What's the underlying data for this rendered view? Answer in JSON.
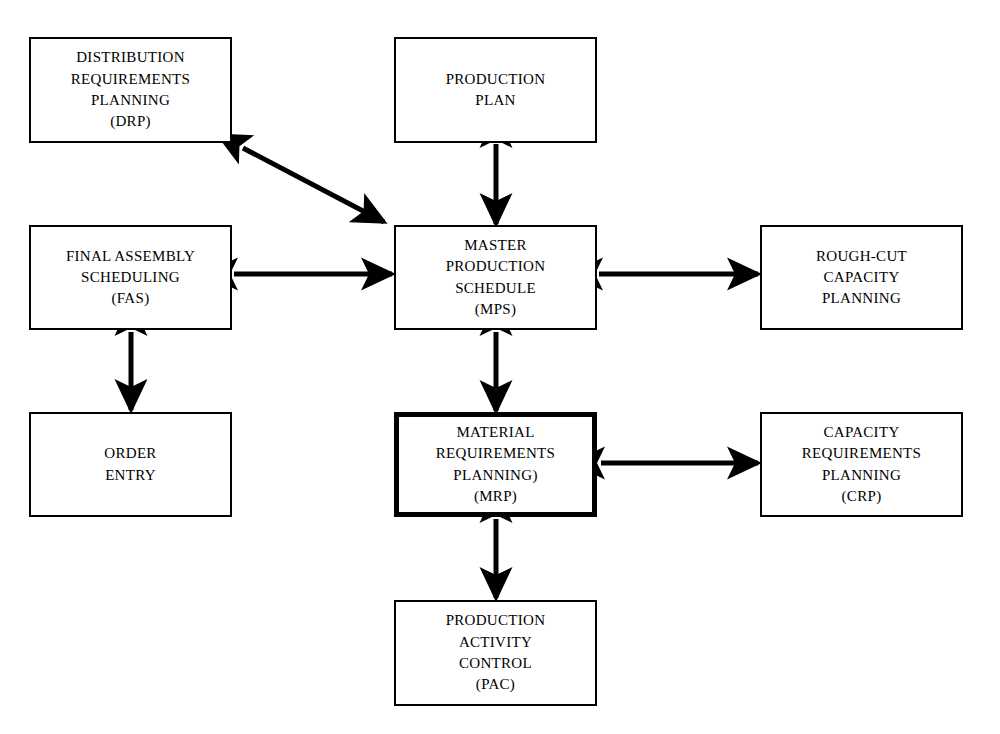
{
  "diagram": {
    "background_color": "#ffffff",
    "line_color": "#000000",
    "nodes": [
      {
        "id": "drp",
        "name": "distribution-requirements-planning",
        "lines": [
          "DISTRIBUTION",
          "REQUIREMENTS",
          "PLANNING",
          "(DRP)"
        ],
        "x": 29,
        "y": 37,
        "w": 203,
        "h": 106,
        "emphasis": false
      },
      {
        "id": "production-plan",
        "name": "production-plan",
        "lines": [
          "PRODUCTION",
          "PLAN"
        ],
        "x": 394,
        "y": 37,
        "w": 203,
        "h": 106,
        "emphasis": false
      },
      {
        "id": "fas",
        "name": "final-assembly-scheduling",
        "lines": [
          "FINAL ASSEMBLY",
          "SCHEDULING",
          "(FAS)"
        ],
        "x": 29,
        "y": 225,
        "w": 203,
        "h": 105,
        "emphasis": false
      },
      {
        "id": "mps",
        "name": "master-production-schedule",
        "lines": [
          "MASTER",
          "PRODUCTION",
          "SCHEDULE",
          "(MPS)"
        ],
        "x": 394,
        "y": 225,
        "w": 203,
        "h": 105,
        "emphasis": false
      },
      {
        "id": "rccp",
        "name": "rough-cut-capacity-planning",
        "lines": [
          "ROUGH-CUT",
          "CAPACITY",
          "PLANNING"
        ],
        "x": 760,
        "y": 225,
        "w": 203,
        "h": 105,
        "emphasis": false
      },
      {
        "id": "order-entry",
        "name": "order-entry",
        "lines": [
          "ORDER",
          "ENTRY"
        ],
        "x": 29,
        "y": 412,
        "w": 203,
        "h": 105,
        "emphasis": false
      },
      {
        "id": "mrp",
        "name": "material-requirements-planning",
        "lines": [
          "MATERIAL",
          "REQUIREMENTS",
          "PLANNING)",
          "(MRP)"
        ],
        "x": 394,
        "y": 412,
        "w": 203,
        "h": 105,
        "emphasis": true
      },
      {
        "id": "crp",
        "name": "capacity-requirements-planning",
        "lines": [
          "CAPACITY",
          "REQUIREMENTS",
          "PLANNING",
          "(CRP)"
        ],
        "x": 760,
        "y": 412,
        "w": 203,
        "h": 105,
        "emphasis": false
      },
      {
        "id": "pac",
        "name": "production-activity-control",
        "lines": [
          "PRODUCTION",
          "ACTIVITY",
          "CONTROL",
          "(PAC)"
        ],
        "x": 394,
        "y": 600,
        "w": 203,
        "h": 106,
        "emphasis": false
      }
    ],
    "connectors": [
      {
        "id": "drp-mps",
        "name": "connector-drp-mps",
        "from": "drp",
        "to": "mps",
        "style": "double-headed",
        "orientation": "diagonal",
        "x1": 243,
        "y1": 148,
        "x2": 384,
        "y2": 222
      },
      {
        "id": "production-plan-mps",
        "name": "connector-production-plan-mps",
        "from": "production-plan",
        "to": "mps",
        "style": "double-headed",
        "orientation": "vertical",
        "x1": 496,
        "y1": 144,
        "x2": 496,
        "y2": 224
      },
      {
        "id": "fas-mps",
        "name": "connector-fas-mps",
        "from": "fas",
        "to": "mps",
        "style": "double-headed",
        "orientation": "horizontal",
        "x1": 234,
        "y1": 274,
        "x2": 392,
        "y2": 274
      },
      {
        "id": "mps-rccp",
        "name": "connector-mps-rough-cut-capacity-planning",
        "from": "mps",
        "to": "rccp",
        "style": "double-headed",
        "orientation": "horizontal",
        "x1": 599,
        "y1": 274,
        "x2": 758,
        "y2": 274
      },
      {
        "id": "fas-order-entry",
        "name": "connector-fas-order-entry",
        "from": "fas",
        "to": "order-entry",
        "style": "double-headed",
        "orientation": "vertical",
        "x1": 131,
        "y1": 332,
        "x2": 131,
        "y2": 410
      },
      {
        "id": "mps-mrp",
        "name": "connector-mps-mrp",
        "from": "mps",
        "to": "mrp",
        "style": "double-headed",
        "orientation": "vertical",
        "x1": 496,
        "y1": 332,
        "x2": 496,
        "y2": 411
      },
      {
        "id": "mrp-crp",
        "name": "connector-mrp-crp",
        "from": "mrp",
        "to": "crp",
        "style": "double-headed",
        "orientation": "horizontal",
        "x1": 601,
        "y1": 463,
        "x2": 758,
        "y2": 463
      },
      {
        "id": "mrp-pac",
        "name": "connector-mrp-pac",
        "from": "mrp",
        "to": "pac",
        "style": "double-headed",
        "orientation": "vertical",
        "x1": 496,
        "y1": 519,
        "x2": 496,
        "y2": 598
      }
    ]
  }
}
